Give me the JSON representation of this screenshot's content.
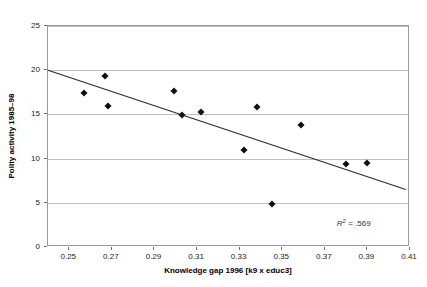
{
  "chart_data": {
    "type": "scatter",
    "title": "",
    "xlabel": "Knowledge gap 1996 [k9 x educ3]",
    "ylabel": "Polity activity 1985–98",
    "xlim": [
      0.24,
      0.41
    ],
    "ylim": [
      0,
      25
    ],
    "xticks": [
      0.25,
      0.27,
      0.29,
      0.31,
      0.33,
      0.35,
      0.37,
      0.39,
      0.41
    ],
    "xtick_labels": [
      "0.25",
      "0.27",
      "0.29",
      "0.31",
      "0.33",
      "0.35",
      "0.37",
      "0.39",
      "0.41"
    ],
    "yticks": [
      0,
      5,
      10,
      15,
      20,
      25
    ],
    "ytick_labels": [
      "0",
      "5",
      "10",
      "15",
      "20",
      "25"
    ],
    "grid": "horizontal",
    "legend": "none",
    "points": [
      {
        "x": 0.257,
        "y": 17.4
      },
      {
        "x": 0.267,
        "y": 19.4
      },
      {
        "x": 0.268,
        "y": 15.9
      },
      {
        "x": 0.299,
        "y": 17.6
      },
      {
        "x": 0.303,
        "y": 14.9
      },
      {
        "x": 0.312,
        "y": 15.3
      },
      {
        "x": 0.332,
        "y": 11.0
      },
      {
        "x": 0.338,
        "y": 15.8
      },
      {
        "x": 0.345,
        "y": 4.9
      },
      {
        "x": 0.359,
        "y": 13.8
      },
      {
        "x": 0.38,
        "y": 9.4
      },
      {
        "x": 0.39,
        "y": 9.5
      }
    ],
    "trendline": {
      "x0": 0.24,
      "y0": 20.0,
      "x1": 0.408,
      "y1": 6.5
    },
    "annotations": [
      {
        "name": "r2",
        "symbol": "R",
        "superscript": "2",
        "equals": " = ",
        "value": ".569",
        "x": 0.392,
        "y": 2.6
      }
    ],
    "colors": {
      "marker": "#111111",
      "trendline": "#2b2b2b",
      "gridline": "#bfbfbf",
      "frame": "#9a9a9a",
      "background": "#ffffff",
      "text": "#222222"
    }
  }
}
